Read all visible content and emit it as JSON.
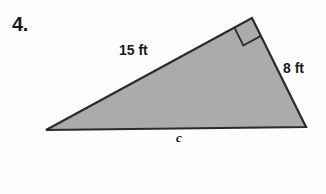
{
  "problem": {
    "number": "4."
  },
  "figure": {
    "shape_name": "right-triangle",
    "fill_color": "#ababab",
    "stroke_color": "#2b2b2b",
    "background_color": "#fdfdfd",
    "vertices": {
      "apex": [
        252,
        18
      ],
      "left": [
        46,
        130
      ],
      "right": [
        306,
        127
      ]
    },
    "right_angle_at": "apex",
    "right_angle_marker_size": 20
  },
  "labels": {
    "hypotenuse": "15 ft",
    "leg": "8 ft",
    "base": "c"
  }
}
